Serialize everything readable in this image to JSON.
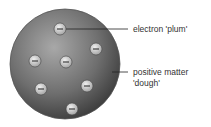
{
  "diagram": {
    "labels": {
      "electron": "electron 'plum'",
      "positive_line1": "positive matter",
      "positive_line2": "'dough'"
    },
    "electron_symbol": "−",
    "electron_count": 7,
    "colors": {
      "sphere_light": "#9a9a9a",
      "sphere_dark": "#3e3e3e",
      "electron_fill": "#d8d8d8",
      "line": "#333333"
    }
  }
}
